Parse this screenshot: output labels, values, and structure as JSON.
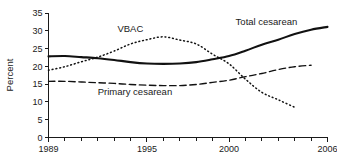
{
  "chart_data": {
    "type": "line",
    "title": "",
    "subtitle": "",
    "xlabel": "",
    "ylabel": "Percent",
    "xlim": [
      1989,
      2006
    ],
    "ylim": [
      0,
      35
    ],
    "grid": false,
    "legend_position": "inline-annotations",
    "y_ticks": [
      0,
      5,
      10,
      15,
      20,
      25,
      30,
      35
    ],
    "y_tick_labels": [
      "0",
      "5",
      "10",
      "15",
      "20",
      "25",
      "30",
      "35"
    ],
    "x_ticks": [
      1989,
      1990,
      1991,
      1992,
      1993,
      1994,
      1995,
      1996,
      1997,
      1998,
      1999,
      2000,
      2001,
      2002,
      2003,
      2004,
      2005,
      2006
    ],
    "x_tick_labels_shown": [
      "1989",
      "1995",
      "2000",
      "2006"
    ],
    "x_labeled_ticks": [
      1989,
      1995,
      2000,
      2006
    ],
    "series": [
      {
        "name": "Total cesarean",
        "style": "solid",
        "color": "#111111",
        "label": "Total cesarean",
        "x": [
          1989,
          1990,
          1991,
          1992,
          1993,
          1994,
          1995,
          1996,
          1997,
          1998,
          1999,
          2000,
          2001,
          2002,
          2003,
          2004,
          2005,
          2006
        ],
        "values": [
          22.8,
          22.9,
          22.6,
          22.3,
          21.8,
          21.2,
          20.8,
          20.7,
          20.8,
          21.2,
          22.0,
          22.9,
          24.4,
          26.1,
          27.5,
          29.1,
          30.3,
          31.1
        ]
      },
      {
        "name": "VBAC",
        "style": "dotted",
        "color": "#111111",
        "label": "VBAC",
        "x": [
          1989,
          1990,
          1991,
          1992,
          1993,
          1994,
          1995,
          1996,
          1997,
          1998,
          1999,
          2000,
          2001,
          2002,
          2003,
          2004
        ],
        "values": [
          18.9,
          19.9,
          21.3,
          22.6,
          24.3,
          26.3,
          27.5,
          28.3,
          27.4,
          26.3,
          23.4,
          20.7,
          16.4,
          12.7,
          10.6,
          8.5
        ]
      },
      {
        "name": "Primary cesarean",
        "style": "dashed",
        "color": "#111111",
        "label": "Primary cesarean",
        "x": [
          1989,
          1990,
          1991,
          1992,
          1993,
          1994,
          1995,
          1996,
          1997,
          1998,
          1999,
          2000,
          2001,
          2002,
          2003,
          2004,
          2005
        ],
        "values": [
          15.8,
          15.8,
          15.6,
          15.4,
          15.2,
          14.9,
          14.7,
          14.6,
          14.6,
          14.9,
          15.5,
          16.1,
          17.1,
          18.0,
          19.1,
          19.9,
          20.3
        ]
      }
    ],
    "annotations": [
      {
        "text": "VBAC",
        "x_year": 1993.2,
        "y_value": 29.6
      },
      {
        "text": "Total cesarean",
        "x_year": 2000.4,
        "y_value": 31.7
      },
      {
        "text": "Primary cesarean",
        "x_year": 1992.0,
        "y_value": 11.9
      }
    ]
  },
  "axes": {
    "y_axis_title": "Percent",
    "x_axis_title": ""
  }
}
